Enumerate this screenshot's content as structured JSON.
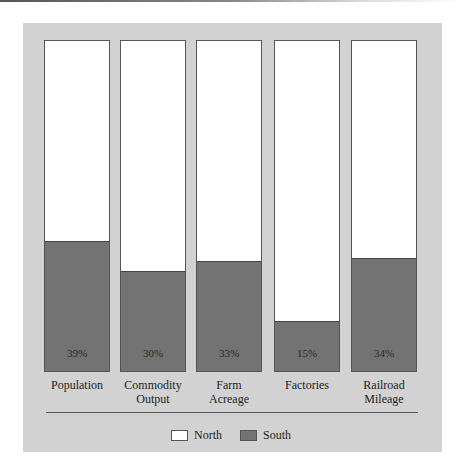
{
  "chart_data": {
    "type": "bar",
    "stacked": true,
    "normalized_to": 100,
    "title": "",
    "xlabel": "",
    "ylabel": "",
    "ylim": [
      0,
      100
    ],
    "categories": [
      "Population",
      "Commodity Output",
      "Farm Acreage",
      "Factories",
      "Railroad Mileage"
    ],
    "series": [
      {
        "name": "South",
        "color": "#737373",
        "values": [
          39,
          30,
          33,
          15,
          34
        ]
      },
      {
        "name": "North",
        "color": "#ffffff",
        "values": [
          61,
          70,
          67,
          85,
          66
        ]
      }
    ],
    "data_labels": [
      "39%",
      "30%",
      "33%",
      "15%",
      "34%"
    ],
    "legend": {
      "position": "bottom",
      "entries": [
        "North",
        "South"
      ]
    },
    "grid": false
  },
  "bars": [
    {
      "label_line1": "Population",
      "label_line2": "",
      "pct_label": "39%",
      "south": 39
    },
    {
      "label_line1": "Commodity",
      "label_line2": "Output",
      "pct_label": "30%",
      "south": 30
    },
    {
      "label_line1": "Farm",
      "label_line2": "Acreage",
      "pct_label": "33%",
      "south": 33
    },
    {
      "label_line1": "Factories",
      "label_line2": "",
      "pct_label": "15%",
      "south": 15
    },
    {
      "label_line1": "Railroad",
      "label_line2": "Mileage",
      "pct_label": "34%",
      "south": 34
    }
  ],
  "legend": {
    "north_label": "North",
    "south_label": "South"
  },
  "colors": {
    "panel": "#d2d2d2",
    "north": "#ffffff",
    "south": "#737373"
  }
}
